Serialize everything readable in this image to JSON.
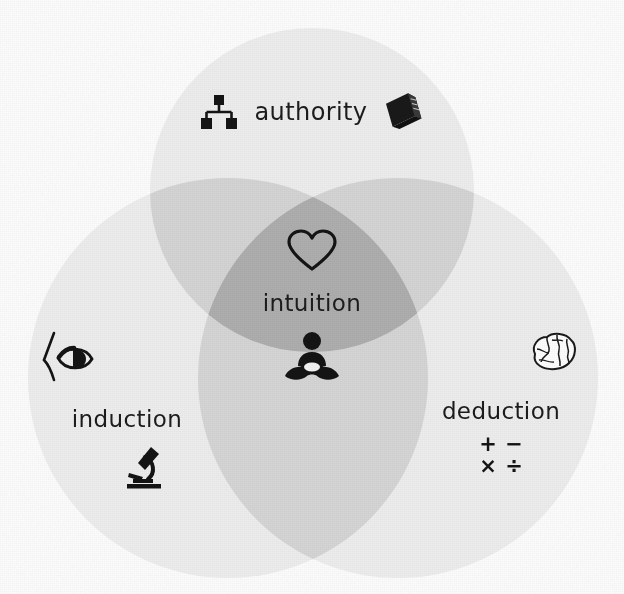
{
  "diagram": {
    "type": "venn",
    "title": "",
    "background_color": "#ffffff",
    "circle_fill": "#ebebeb",
    "overlap_fill": "#dcdcdc",
    "text_color": "#1c1c1c",
    "sets": [
      {
        "id": "authority",
        "label": "authority",
        "position": "top",
        "icons": [
          {
            "name": "hierarchy-icon",
            "description": "organizational chart"
          },
          {
            "name": "book-icon",
            "description": "closed book"
          }
        ]
      },
      {
        "id": "induction",
        "label": "induction",
        "position": "bottom-left",
        "icons": [
          {
            "name": "eye-icon",
            "description": "eye in profile"
          },
          {
            "name": "microscope-icon",
            "description": "microscope"
          }
        ]
      },
      {
        "id": "deduction",
        "label": "deduction",
        "position": "bottom-right",
        "icons": [
          {
            "name": "brain-icon",
            "description": "human brain"
          },
          {
            "name": "math-operators-icon",
            "description": "arithmetic symbols"
          }
        ]
      }
    ],
    "intersection": {
      "id": "intuition",
      "label": "intuition",
      "position": "center",
      "icons": [
        {
          "name": "heart-icon",
          "description": "heart outline"
        },
        {
          "name": "meditating-person-icon",
          "description": "person seated in lotus pose"
        }
      ]
    },
    "math_operators": [
      "+",
      "−",
      "×",
      "÷"
    ]
  }
}
